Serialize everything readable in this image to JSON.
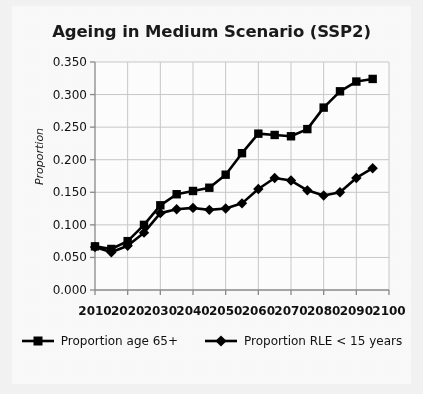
{
  "chart_data": {
    "type": "line",
    "title": "Ageing in Medium Scenario (SSP2)",
    "xlabel": "",
    "ylabel": "Proportion",
    "xlim": [
      2010,
      2100
    ],
    "ylim": [
      0.0,
      0.35
    ],
    "grid": true,
    "legend_position": "bottom",
    "x_ticks": [
      "2010",
      "2020",
      "2030",
      "2040",
      "2050",
      "2060",
      "2070",
      "2080",
      "2090",
      "2100"
    ],
    "y_ticks": [
      "0.000",
      "0.050",
      "0.100",
      "0.150",
      "0.200",
      "0.250",
      "0.300",
      "0.350"
    ],
    "x": [
      2010,
      2015,
      2020,
      2025,
      2030,
      2035,
      2040,
      2045,
      2050,
      2055,
      2060,
      2065,
      2070,
      2075,
      2080,
      2085,
      2090,
      2095
    ],
    "series": [
      {
        "name": "Proportion age 65+",
        "marker": "square",
        "color": "#000000",
        "values": [
          0.067,
          0.063,
          0.075,
          0.1,
          0.13,
          0.147,
          0.152,
          0.157,
          0.177,
          0.21,
          0.24,
          0.238,
          0.236,
          0.247,
          0.28,
          0.305,
          0.32,
          0.324
        ]
      },
      {
        "name": "Proportion RLE < 15 years",
        "marker": "diamond",
        "color": "#000000",
        "values": [
          0.066,
          0.058,
          0.068,
          0.088,
          0.118,
          0.124,
          0.126,
          0.123,
          0.125,
          0.133,
          0.155,
          0.172,
          0.168,
          0.153,
          0.145,
          0.15,
          0.172,
          0.187
        ]
      }
    ]
  },
  "legend": {
    "items": [
      {
        "label": "Proportion age 65+",
        "marker": "square"
      },
      {
        "label": "Proportion RLE < 15 years",
        "marker": "diamond"
      }
    ]
  },
  "colors": {
    "series": "#000000",
    "grid": "#c9c9c9",
    "axis": "#8a8a8a",
    "text": "#111111",
    "background": "#f4f4f4",
    "plate": "#fbfbfb"
  }
}
